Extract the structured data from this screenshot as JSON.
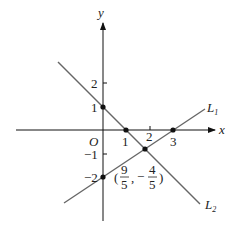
{
  "axes": {
    "x_label": "x",
    "y_label": "y",
    "origin_label": "O",
    "x_ticks": [
      "1",
      "2",
      "3"
    ],
    "y_ticks": [
      "2",
      "1",
      "−1",
      "−2"
    ]
  },
  "lines": {
    "L1": {
      "name": "L",
      "sub": "1",
      "equation_points": [
        [
          0,
          -2
        ],
        [
          3,
          0
        ]
      ]
    },
    "L2": {
      "name": "L",
      "sub": "2",
      "equation_points": [
        [
          0,
          1
        ],
        [
          1,
          0
        ]
      ]
    }
  },
  "intersection": {
    "open": "(",
    "x_num": "9",
    "x_den": "5",
    "comma": ",",
    "minus": "−",
    "y_num": "4",
    "y_den": "5",
    "close": ")"
  },
  "colors": {
    "axis": "#111111",
    "line": "#666666",
    "point": "#111111"
  }
}
